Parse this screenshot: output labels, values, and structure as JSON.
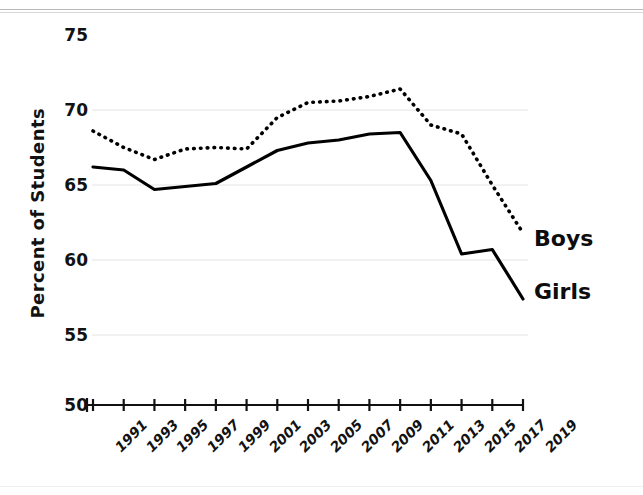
{
  "chart_data": {
    "type": "line",
    "title": "",
    "subtitle": "",
    "xlabel": "",
    "ylabel": "Percent of Students",
    "categories": [
      "1991",
      "1993",
      "1995",
      "1997",
      "1999",
      "2001",
      "2003",
      "2005",
      "2007",
      "2009",
      "2011",
      "2013",
      "2015",
      "2017",
      "2019"
    ],
    "x": [
      1991,
      1993,
      1995,
      1997,
      1999,
      2001,
      2003,
      2005,
      2007,
      2009,
      2011,
      2013,
      2015,
      2017,
      2019
    ],
    "series": [
      {
        "name": "Boys",
        "style": "dotted",
        "color": "#000000",
        "values": [
          68.6,
          67.5,
          66.7,
          67.4,
          67.5,
          67.4,
          69.5,
          70.5,
          70.6,
          70.9,
          71.4,
          69.0,
          68.4,
          65.0,
          61.8
        ]
      },
      {
        "name": "Girls",
        "style": "solid",
        "color": "#000000",
        "values": [
          66.2,
          66.0,
          64.7,
          64.9,
          65.1,
          66.2,
          67.3,
          67.8,
          68.0,
          68.4,
          68.5,
          65.3,
          60.4,
          60.7,
          57.4
        ]
      }
    ],
    "ylim": [
      50,
      75
    ],
    "yticks": [
      50,
      55,
      60,
      65,
      70,
      75
    ],
    "ytick_labels": [
      "50",
      "55",
      "60",
      "65",
      "70",
      "75"
    ],
    "xlim": [
      1991,
      2019
    ],
    "grid": true,
    "grid_color": "#e4e4e4",
    "legend": "inline-right",
    "axis_color": "#111111"
  },
  "annotations": {
    "boys_label": "Boys",
    "girls_label": "Girls"
  }
}
